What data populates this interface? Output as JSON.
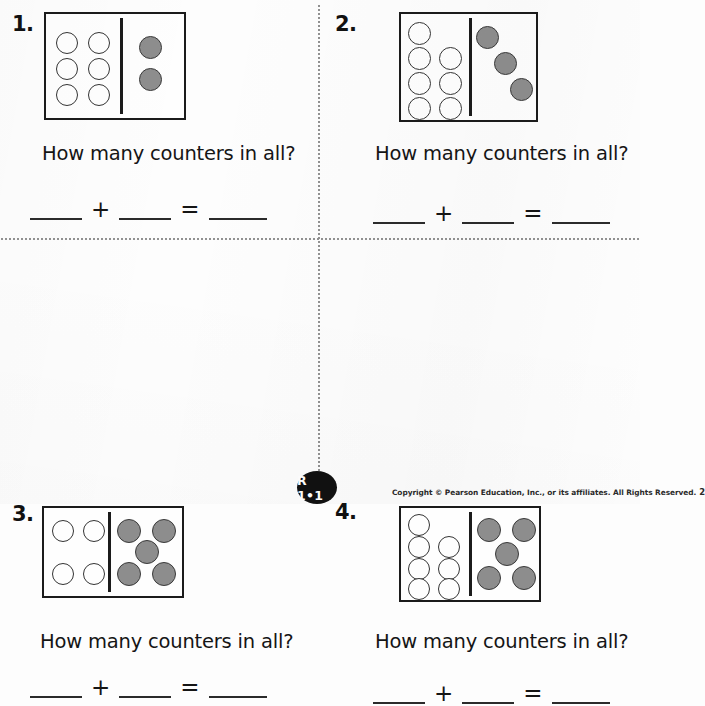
{
  "worksheet": {
    "question_text": "How many counters in all?",
    "operators": {
      "plus": "+",
      "equals": "="
    },
    "colors": {
      "counter_fill_gray": "#8d8d8d",
      "counter_fill_white": "#fefefe",
      "counter_outline": "#343434",
      "mat_border": "#1b1b1b",
      "ink": "#151515",
      "page_background": "#fdfdfd",
      "badge_background": "#111111"
    },
    "problems": [
      {
        "number": "1.",
        "question": "How many counters in all?",
        "white_counters": 6,
        "gray_counters": 2,
        "white_positions": [
          {
            "x": 10,
            "y": 18
          },
          {
            "x": 42,
            "y": 18
          },
          {
            "x": 10,
            "y": 44
          },
          {
            "x": 42,
            "y": 44
          },
          {
            "x": 10,
            "y": 70
          },
          {
            "x": 42,
            "y": 70
          }
        ],
        "gray_positions": [
          {
            "x": 26,
            "y": 22
          },
          {
            "x": 26,
            "y": 54
          }
        ],
        "blanks": [
          "",
          "",
          ""
        ]
      },
      {
        "number": "2.",
        "question": "How many counters in all?",
        "white_counters": 7,
        "gray_counters": 3,
        "white_positions": [
          {
            "x": 7,
            "y": 8
          },
          {
            "x": 7,
            "y": 33
          },
          {
            "x": 38,
            "y": 33
          },
          {
            "x": 7,
            "y": 58
          },
          {
            "x": 38,
            "y": 58
          },
          {
            "x": 7,
            "y": 83
          },
          {
            "x": 38,
            "y": 83
          }
        ],
        "gray_positions": [
          {
            "x": 6,
            "y": 12
          },
          {
            "x": 24,
            "y": 38
          },
          {
            "x": 42,
            "y": 64
          }
        ],
        "blanks": [
          "",
          "",
          ""
        ]
      },
      {
        "number": "3.",
        "question": "How many counters in all?",
        "white_counters": 4,
        "gray_counters": 5,
        "white_positions": [
          {
            "x": 8,
            "y": 12
          },
          {
            "x": 39,
            "y": 12
          },
          {
            "x": 8,
            "y": 55
          },
          {
            "x": 39,
            "y": 55
          }
        ],
        "gray_positions": [
          {
            "x": 8,
            "y": 11
          },
          {
            "x": 45,
            "y": 11
          },
          {
            "x": 27,
            "y": 33
          },
          {
            "x": 8,
            "y": 55
          },
          {
            "x": 45,
            "y": 55
          }
        ],
        "blanks": [
          "",
          "",
          ""
        ]
      },
      {
        "number": "4.",
        "question": "How many counters in all?",
        "white_counters": 7,
        "gray_counters": 5,
        "white_positions": [
          {
            "x": 7,
            "y": 8
          },
          {
            "x": 7,
            "y": 30
          },
          {
            "x": 37,
            "y": 30
          },
          {
            "x": 7,
            "y": 52
          },
          {
            "x": 37,
            "y": 52
          },
          {
            "x": 7,
            "y": 74
          },
          {
            "x": 37,
            "y": 74
          }
        ],
        "gray_positions": [
          {
            "x": 8,
            "y": 10
          },
          {
            "x": 44,
            "y": 10
          },
          {
            "x": 26,
            "y": 35
          },
          {
            "x": 8,
            "y": 58
          },
          {
            "x": 44,
            "y": 58
          }
        ],
        "blanks": [
          "",
          "",
          ""
        ]
      }
    ]
  },
  "footer": {
    "badge_label": "R 1•1",
    "copyright": "Copyright © Pearson Education, Inc., or its affiliates. All Rights Reserved.",
    "page_number": "2"
  }
}
